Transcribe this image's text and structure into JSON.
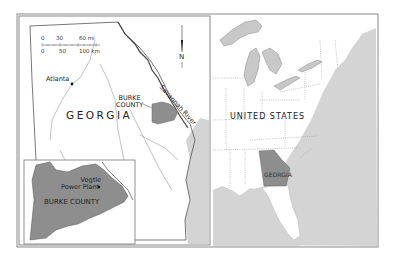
{
  "map": {
    "labels": {
      "georgia": "GEORGIA",
      "burke_county_main": "BURKE\nCOUNTY",
      "burke_county_line1": "BURKE",
      "burke_county_line2": "COUNTY",
      "atlanta": "Atlanta",
      "savannah_river": "Savannah River",
      "united_states": "UNITED STATES",
      "georgia_us": "GEORGIA",
      "burke_county_inset": "BURKE COUNTY",
      "vogtle_line1": "Vogtle",
      "vogtle_line2": "Power Plant"
    },
    "north_arrow": {
      "label": "N"
    },
    "scale_bar": {
      "miles": [
        "0",
        "30",
        "60 mi"
      ],
      "km": [
        "0",
        "50",
        "100 km"
      ]
    },
    "colors": {
      "land": "#ffffff",
      "water": "#d4d4d4",
      "highlight": "#8e8e8e",
      "border": "#7a7a7a",
      "lakes": "#c8c8c8"
    }
  }
}
